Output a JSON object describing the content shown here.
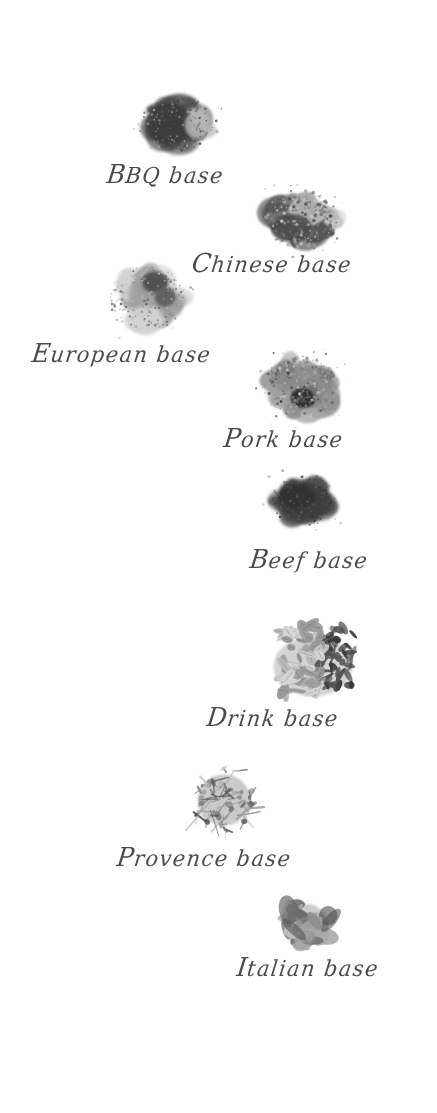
{
  "page": {
    "background_color": "#ffffff",
    "label_color": "#3c3c3c",
    "width": 437,
    "height": 1113,
    "kind": "spice-base-catalog"
  },
  "items": [
    {
      "id": "bbq",
      "label": "BBQ base",
      "pile_name": "bbq-spice-pile",
      "pile_description": "dark charcoal ground spice powder with a lighter grey patch on the right",
      "pile": {
        "x": 138,
        "y": 93,
        "w": 78,
        "h": 62
      },
      "text": {
        "x": 107,
        "y": 160
      },
      "tones": [
        "#4a4a4a",
        "#3b3b3b",
        "#606060",
        "#9a9a9a",
        "#b5b5b5"
      ],
      "texture": "fine-powder"
    },
    {
      "id": "chinese",
      "label": "Chinese base",
      "pile_name": "chinese-spice-pile",
      "pile_description": "dark grey ground powder at lower-left with pale speckled granules spilling to the upper-right",
      "pile": {
        "x": 261,
        "y": 186,
        "w": 80,
        "h": 66
      },
      "text": {
        "x": 192,
        "y": 249
      },
      "tones": [
        "#565656",
        "#474747",
        "#787878",
        "#aaaaaa",
        "#cfcfcf"
      ],
      "texture": "coarse-granule"
    },
    {
      "id": "european",
      "label": "European base",
      "pile_name": "european-spice-pile",
      "pile_description": "pale grey powder base with two dark grey clumps sitting on top",
      "pile": {
        "x": 106,
        "y": 262,
        "w": 82,
        "h": 72
      },
      "text": {
        "x": 32,
        "y": 339
      },
      "tones": [
        "#9d9d9d",
        "#b8b8b8",
        "#4e4e4e",
        "#5e5e5e",
        "#d2d2d2"
      ],
      "texture": "fine-powder"
    },
    {
      "id": "pork",
      "label": "Pork base",
      "pile_name": "pork-spice-pile",
      "pile_description": "medium grey granular mound with a small very dark clump at the front centre",
      "pile": {
        "x": 261,
        "y": 352,
        "w": 80,
        "h": 70
      },
      "text": {
        "x": 224,
        "y": 424
      },
      "tones": [
        "#8e8e8e",
        "#a5a5a5",
        "#6f6f6f",
        "#2e2e2e",
        "#c4c4c4"
      ],
      "texture": "coarse-granule"
    },
    {
      "id": "beef",
      "label": "Beef base",
      "pile_name": "beef-spice-pile",
      "pile_description": "solid dark charcoal oval mound of finely ground spice",
      "pile": {
        "x": 268,
        "y": 473,
        "w": 72,
        "h": 56
      },
      "text": {
        "x": 250,
        "y": 545
      },
      "tones": [
        "#4a4a4a",
        "#3c3c3c",
        "#585858",
        "#2f2f2f",
        "#6a6a6a"
      ],
      "texture": "fine-powder"
    },
    {
      "id": "drink",
      "label": "Drink base",
      "pile_name": "drink-spice-pile",
      "pile_description": "heap of pale cardamom pods on the left mixed with very dark cloves on the right",
      "pile": {
        "x": 266,
        "y": 616,
        "w": 94,
        "h": 84
      },
      "text": {
        "x": 207,
        "y": 703
      },
      "tones": [
        "#b9b9b9",
        "#9a9a9a",
        "#d6d6d6",
        "#3a3a3a",
        "#555555"
      ],
      "texture": "whole-pods"
    },
    {
      "id": "provence",
      "label": "Provence base",
      "pile_name": "provence-herb-pile",
      "pile_description": "cluster of dried lavender sprigs and mixed herbes de Provence",
      "pile": {
        "x": 185,
        "y": 760,
        "w": 78,
        "h": 80
      },
      "text": {
        "x": 117,
        "y": 843
      },
      "tones": [
        "#8a8a8a",
        "#a6a6a6",
        "#636363",
        "#c8c8c8",
        "#4d4d4d"
      ],
      "texture": "dried-herbs"
    },
    {
      "id": "italian",
      "label": "Italian base",
      "pile_name": "italian-herb-pile",
      "pile_description": "small bunch of dried basil and oregano leaves",
      "pile": {
        "x": 272,
        "y": 892,
        "w": 66,
        "h": 64
      },
      "text": {
        "x": 237,
        "y": 953
      },
      "tones": [
        "#8d8d8d",
        "#a8a8a8",
        "#6b6b6b",
        "#c2c2c2",
        "#515151"
      ],
      "texture": "dried-leaves"
    }
  ]
}
